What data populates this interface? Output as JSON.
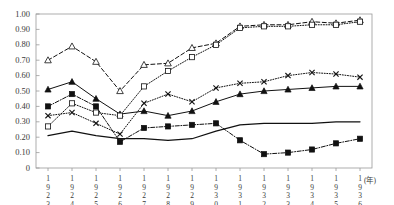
{
  "chart_data": {
    "type": "line",
    "title": "",
    "xlabel": "(年)",
    "ylabel": "",
    "ylim": [
      0,
      1.0
    ],
    "ytick_labels": [
      "1.00",
      "0.90",
      "0.80",
      "0.70",
      "0.60",
      "0.50",
      "0.40",
      "0.30",
      "0.20",
      "0.10",
      "0"
    ],
    "ytick_values": [
      1.0,
      0.9,
      0.8,
      0.7,
      0.6,
      0.5,
      0.4,
      0.3,
      0.2,
      0.1,
      0
    ],
    "grid": false,
    "legend": "none",
    "x_axis_unit_label": "(年)",
    "categories": [
      "1923",
      "1924",
      "1925",
      "1926",
      "1927",
      "1928",
      "1929",
      "1930",
      "1931",
      "1932",
      "1933",
      "1934",
      "1935",
      "1936"
    ],
    "series": [
      {
        "name": "series-open-triangle",
        "marker": "open-triangle",
        "linestyle": "dashed",
        "values": [
          0.7,
          0.79,
          0.69,
          0.5,
          0.67,
          0.68,
          0.78,
          0.81,
          0.92,
          0.93,
          0.93,
          0.95,
          0.94,
          0.96
        ]
      },
      {
        "name": "series-filled-triangle",
        "marker": "filled-triangle",
        "linestyle": "solid",
        "values": [
          0.51,
          0.56,
          0.45,
          0.35,
          0.37,
          0.34,
          0.37,
          0.43,
          0.48,
          0.5,
          0.51,
          0.52,
          0.53,
          0.53
        ]
      },
      {
        "name": "series-filled-square",
        "marker": "filled-square",
        "linestyle": "dash-dot",
        "values": [
          0.4,
          0.48,
          0.4,
          0.17,
          0.26,
          0.27,
          0.28,
          0.29,
          0.18,
          0.09,
          0.1,
          0.12,
          0.16,
          0.19
        ]
      },
      {
        "name": "series-open-square",
        "marker": "open-square",
        "linestyle": "dotted",
        "values": [
          0.27,
          0.42,
          0.36,
          0.34,
          0.53,
          0.63,
          0.72,
          0.8,
          0.91,
          0.92,
          0.92,
          0.93,
          0.93,
          0.95
        ]
      },
      {
        "name": "series-cross",
        "marker": "cross",
        "linestyle": "dotted",
        "values": [
          0.34,
          0.36,
          0.29,
          0.22,
          0.42,
          0.48,
          0.43,
          0.52,
          0.55,
          0.56,
          0.6,
          0.62,
          0.61,
          0.59
        ]
      },
      {
        "name": "series-plain-line",
        "marker": "none",
        "linestyle": "solid",
        "values": [
          0.21,
          0.24,
          0.21,
          0.19,
          0.19,
          0.18,
          0.19,
          0.24,
          0.28,
          0.29,
          0.29,
          0.29,
          0.3,
          0.3
        ]
      }
    ]
  }
}
